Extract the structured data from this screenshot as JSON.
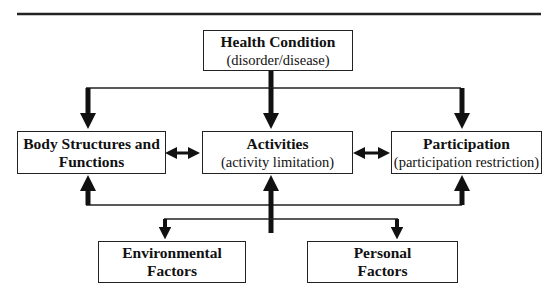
{
  "diagram": {
    "colors": {
      "line": "#111111",
      "box_border": "#222222",
      "background": "#ffffff"
    },
    "nodes": {
      "health": {
        "title": "Health Condition",
        "subtitle": "(disorder/disease)"
      },
      "body": {
        "title_line1": "Body Structures and",
        "title_line2": "Functions"
      },
      "activities": {
        "title": "Activities",
        "subtitle": "(activity limitation)"
      },
      "participation": {
        "title": "Participation",
        "subtitle": "(participation restriction)"
      },
      "environmental": {
        "title_line1": "Environmental",
        "title_line2": "Factors"
      },
      "personal": {
        "title_line1": "Personal",
        "title_line2": "Factors"
      }
    },
    "edges": [
      {
        "from": "health",
        "to": "body",
        "type": "arrow"
      },
      {
        "from": "health",
        "to": "activities",
        "type": "arrow"
      },
      {
        "from": "health",
        "to": "participation",
        "type": "arrow"
      },
      {
        "from": "body",
        "to": "activities",
        "type": "bidirectional"
      },
      {
        "from": "activities",
        "to": "participation",
        "type": "bidirectional"
      },
      {
        "from": "contextual",
        "to": "body",
        "type": "arrow"
      },
      {
        "from": "contextual",
        "to": "activities",
        "type": "arrow"
      },
      {
        "from": "contextual",
        "to": "participation",
        "type": "arrow"
      },
      {
        "from": "contextual",
        "to": "environmental",
        "type": "arrow"
      },
      {
        "from": "contextual",
        "to": "personal",
        "type": "arrow"
      }
    ]
  }
}
